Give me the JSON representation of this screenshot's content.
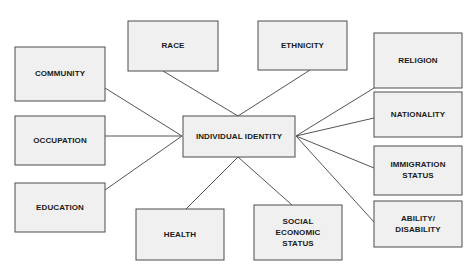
{
  "diagram": {
    "type": "hub-and-spoke-concept-map",
    "style": {
      "box_fill": "#f0f0f0",
      "box_border": "#4d4d4d",
      "connector_color": "#545454",
      "text_color": "#1a1a1a",
      "background": "#ffffff"
    },
    "center": {
      "id": "individual-identity",
      "label": "INDIVIDUAL IDENTITY",
      "lines": [
        "INDIVIDUAL IDENTITY"
      ],
      "x": 183,
      "y": 116,
      "w": 112,
      "h": 41
    },
    "nodes": [
      {
        "id": "community",
        "label": "COMMUNITY",
        "lines": [
          "COMMUNITY"
        ],
        "x": 15,
        "y": 47,
        "w": 90,
        "h": 54,
        "column": "left"
      },
      {
        "id": "occupation",
        "label": "OCCUPATION",
        "lines": [
          "OCCUPATION"
        ],
        "x": 15,
        "y": 116,
        "w": 90,
        "h": 49,
        "column": "left"
      },
      {
        "id": "education",
        "label": "EDUCATION",
        "lines": [
          "EDUCATION"
        ],
        "x": 15,
        "y": 183,
        "w": 90,
        "h": 49,
        "column": "left"
      },
      {
        "id": "race",
        "label": "RACE",
        "lines": [
          "RACE"
        ],
        "x": 128,
        "y": 21,
        "w": 90,
        "h": 50,
        "column": "top"
      },
      {
        "id": "ethnicity",
        "label": "ETHNICITY",
        "lines": [
          "ETHNICITY"
        ],
        "x": 258,
        "y": 21,
        "w": 89,
        "h": 49,
        "column": "top"
      },
      {
        "id": "religion",
        "label": "RELIGION",
        "lines": [
          "RELIGION"
        ],
        "x": 374,
        "y": 33,
        "w": 88,
        "h": 55,
        "column": "right"
      },
      {
        "id": "nationality",
        "label": "NATIONALITY",
        "lines": [
          "NATIONALITY"
        ],
        "x": 374,
        "y": 92,
        "w": 88,
        "h": 45,
        "column": "right"
      },
      {
        "id": "immigration-status",
        "label": "IMMIGRATION STATUS",
        "lines": [
          "IMMIGRATION",
          "STATUS"
        ],
        "x": 374,
        "y": 146,
        "w": 88,
        "h": 49,
        "column": "right"
      },
      {
        "id": "ability-disability",
        "label": "ABILITY/ DISABILITY",
        "lines": [
          "ABILITY/",
          "DISABILITY"
        ],
        "x": 374,
        "y": 201,
        "w": 88,
        "h": 46,
        "column": "right"
      },
      {
        "id": "health",
        "label": "HEALTH",
        "lines": [
          "HEALTH"
        ],
        "x": 136,
        "y": 209,
        "w": 88,
        "h": 51,
        "column": "bottom"
      },
      {
        "id": "social-economic-status",
        "label": "SOCIAL ECONOMIC STATUS",
        "lines": [
          "SOCIAL",
          "ECONOMIC",
          "STATUS"
        ],
        "x": 254,
        "y": 205,
        "w": 88,
        "h": 55,
        "column": "bottom"
      }
    ],
    "connectors": [
      {
        "id": "community-to-center",
        "from": "community",
        "to": "individual-identity",
        "x1": 105,
        "y1": 88,
        "x2": 182,
        "y2": 136
      },
      {
        "id": "occupation-to-center",
        "from": "occupation",
        "to": "individual-identity",
        "x1": 105,
        "y1": 136,
        "x2": 182,
        "y2": 136
      },
      {
        "id": "education-to-center",
        "from": "education",
        "to": "individual-identity",
        "x1": 105,
        "y1": 190,
        "x2": 182,
        "y2": 136
      },
      {
        "id": "race-to-center",
        "from": "race",
        "to": "individual-identity",
        "x1": 163,
        "y1": 71,
        "x2": 238,
        "y2": 116
      },
      {
        "id": "ethnicity-to-center",
        "from": "ethnicity",
        "to": "individual-identity",
        "x1": 310,
        "y1": 70,
        "x2": 238,
        "y2": 116
      },
      {
        "id": "religion-to-center",
        "from": "religion",
        "to": "individual-identity",
        "x1": 374,
        "y1": 88,
        "x2": 296,
        "y2": 136
      },
      {
        "id": "nationality-to-center",
        "from": "nationality",
        "to": "individual-identity",
        "x1": 374,
        "y1": 118,
        "x2": 296,
        "y2": 136
      },
      {
        "id": "immigration-status-to-center",
        "from": "immigration-status",
        "to": "individual-identity",
        "x1": 374,
        "y1": 168,
        "x2": 296,
        "y2": 136
      },
      {
        "id": "ability-disability-to-center",
        "from": "ability-disability",
        "to": "individual-identity",
        "x1": 374,
        "y1": 222,
        "x2": 296,
        "y2": 136
      },
      {
        "id": "health-to-center",
        "from": "health",
        "to": "individual-identity",
        "x1": 186,
        "y1": 209,
        "x2": 238,
        "y2": 157
      },
      {
        "id": "social-economic-status-to-center",
        "from": "social-economic-status",
        "to": "individual-identity",
        "x1": 292,
        "y1": 205,
        "x2": 238,
        "y2": 157
      }
    ]
  }
}
